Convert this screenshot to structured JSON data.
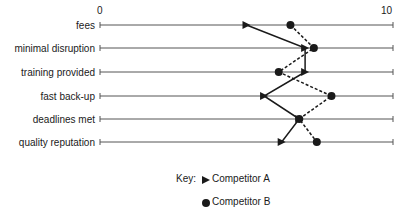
{
  "chart_data": {
    "type": "scatter",
    "title": "",
    "xlabel": "",
    "ylabel": "",
    "xlim": [
      0,
      10
    ],
    "x_tick_labels": [
      "0",
      "10"
    ],
    "grid": false,
    "legend_position": "bottom",
    "categories": [
      "fees",
      "minimal disruption",
      "training provided",
      "fast back-up",
      "deadlines met",
      "quality reputation"
    ],
    "series": [
      {
        "name": "Competitor A",
        "marker": "triangle",
        "line": "solid",
        "values": [
          5.0,
          7.0,
          7.0,
          5.6,
          6.8,
          6.2
        ]
      },
      {
        "name": "Competitor B",
        "marker": "circle",
        "line": "dashed",
        "values": [
          6.5,
          7.3,
          6.1,
          7.9,
          6.8,
          7.4
        ]
      }
    ]
  },
  "legend": {
    "key_label": "Key:",
    "items": [
      "Competitor A",
      "Competitor B"
    ]
  }
}
